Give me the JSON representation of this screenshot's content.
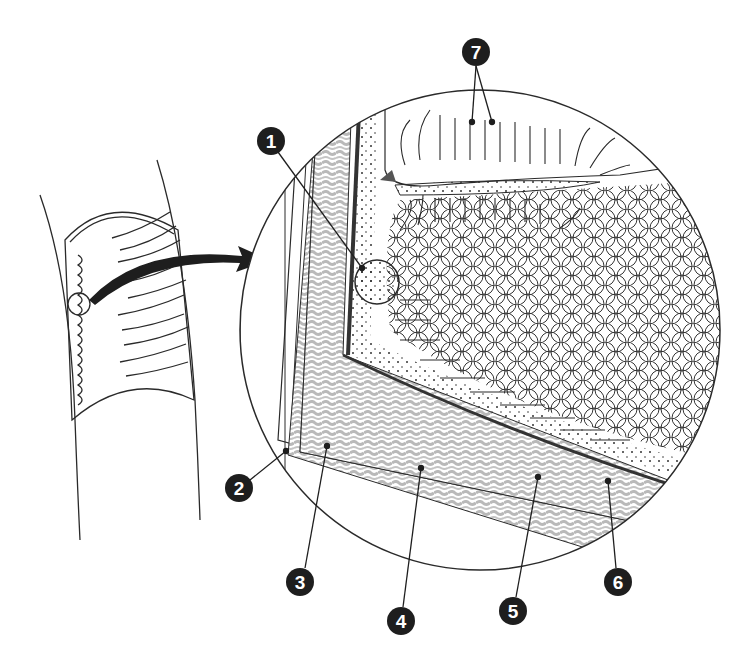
{
  "diagram": {
    "inset_detail": "Magnified wedge of intestinal wall with villi, circular folds and lymphoid nodule",
    "callouts": [
      {
        "id": "1",
        "label": "1",
        "x": 271,
        "y": 141,
        "target_x": 362,
        "target_y": 268,
        "target": "lymphoid-nodule"
      },
      {
        "id": "2",
        "label": "2",
        "x": 239,
        "y": 488,
        "target_x": 286,
        "target_y": 451,
        "target": "outer-layer"
      },
      {
        "id": "3",
        "label": "3",
        "x": 300,
        "y": 582,
        "target_x": 327,
        "target_y": 446,
        "target": "longitudinal-muscle"
      },
      {
        "id": "4",
        "label": "4",
        "x": 401,
        "y": 621,
        "target_x": 421,
        "target_y": 468,
        "target": "circular-muscle"
      },
      {
        "id": "5",
        "label": "5",
        "x": 513,
        "y": 611,
        "target_x": 538,
        "target_y": 477,
        "target": "submucosa"
      },
      {
        "id": "6",
        "label": "6",
        "x": 618,
        "y": 582,
        "target_x": 608,
        "target_y": 481,
        "target": "mucosa"
      },
      {
        "id": "7",
        "label": "7",
        "x": 476,
        "y": 52,
        "targets": [
          [
            472,
            122
          ],
          [
            492,
            122
          ]
        ],
        "target": "villi"
      }
    ],
    "colors": {
      "line": "#2a2a2a",
      "label_fill": "#1e1e1e",
      "label_text": "#ffffff",
      "muscle_gray": "#b9b9b9",
      "background": "#ffffff"
    }
  }
}
